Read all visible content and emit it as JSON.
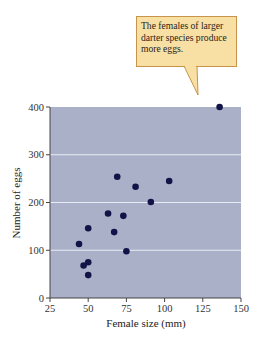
{
  "callout": {
    "text": "The females of larger darter species produce more eggs."
  },
  "colors": {
    "plot_bg": "#a9b0c8",
    "point": "#141347",
    "gridline": "#e8ecf6",
    "callout_bg": "#f8e0a4",
    "callout_border": "#c8944a"
  },
  "chart_data": {
    "type": "scatter",
    "title": "",
    "xlabel": "Female size (mm)",
    "ylabel": "Number of eggs",
    "xlim": [
      25,
      150
    ],
    "ylim": [
      0,
      400
    ],
    "xticks": [
      25,
      50,
      75,
      100,
      125,
      150
    ],
    "yticks": [
      0,
      100,
      200,
      300,
      400
    ],
    "grid": "horizontal at 100, 200, 300",
    "annotations": [
      "The females of larger darter species produce more eggs."
    ],
    "series": [
      {
        "name": "Darter species",
        "x": [
          44,
          47,
          50,
          50,
          50,
          63,
          67,
          69,
          73,
          75,
          81,
          91,
          103,
          136
        ],
        "y": [
          113,
          68,
          48,
          75,
          146,
          177,
          138,
          254,
          172,
          98,
          233,
          201,
          245,
          400
        ]
      }
    ]
  }
}
